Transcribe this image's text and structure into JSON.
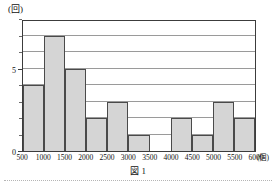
{
  "figure": {
    "caption": "図 1"
  },
  "chart_data": {
    "type": "bar",
    "title": "",
    "xlabel": "",
    "ylabel": "",
    "x_unit": "(個)",
    "y_unit": "(回)",
    "grid": true,
    "legend": "none",
    "categories": [
      "500-1000",
      "1000-1500",
      "1500-2000",
      "2000-2500",
      "2500-3000",
      "3000-3500",
      "3500-4000",
      "4000-4500",
      "4500-5000",
      "5000-5500",
      "5500-6000"
    ],
    "values": [
      4,
      7,
      5,
      2,
      3,
      1,
      0,
      2,
      1,
      3,
      2
    ],
    "x_tick_labels": [
      "500",
      "1000",
      "1500",
      "2000",
      "2500",
      "3000",
      "3500",
      "4000",
      "4500",
      "5000",
      "5500",
      "6000"
    ],
    "y_tick_labels": [
      "0",
      "5"
    ],
    "y_tick_values": [
      0,
      5
    ],
    "y_gridline_values": [
      1,
      2,
      3,
      4,
      5,
      6,
      7,
      8
    ],
    "xlim": [
      500,
      6000
    ],
    "ylim": [
      0,
      8
    ],
    "bar_fill_color": "#d5d5d5",
    "bar_border_color": "#4a4a4a",
    "gridline_color": "#9a9a9a",
    "axis_color": "#3c3c3c"
  }
}
